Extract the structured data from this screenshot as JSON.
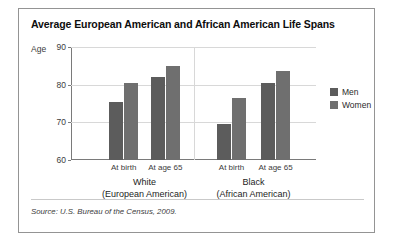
{
  "figure": {
    "title": "Average European American and African American Life Spans",
    "source_note": "Source: U.S. Bureau of the Census, 2009."
  },
  "legend": {
    "position": "right",
    "entries": [
      {
        "label": "Men",
        "color": "#5c5c5c"
      },
      {
        "label": "Women",
        "color": "#6f6f6f"
      }
    ]
  },
  "axis": {
    "y_axis_title": "Age",
    "ticks": [
      "90",
      "80",
      "70",
      "60"
    ]
  },
  "groups": [
    {
      "name": "White",
      "subtitle": "(European American)",
      "subcategories": [
        "At birth",
        "At age 65"
      ]
    },
    {
      "name": "Black",
      "subtitle": "(African American)",
      "subcategories": [
        "At birth",
        "At age 65"
      ]
    }
  ],
  "chart_data": {
    "type": "bar",
    "title": "Average European American and African American Life Spans",
    "xlabel": "",
    "ylabel": "Age",
    "ylim": [
      60,
      90
    ],
    "yticks": [
      60,
      70,
      80,
      90
    ],
    "grid": true,
    "legend_position": "right",
    "categories": [
      "White (European American) — At birth",
      "White (European American) — At age 65",
      "Black (African American) — At birth",
      "Black (African American) — At age 65"
    ],
    "series": [
      {
        "name": "Men",
        "color": "#5c5c5c",
        "values": [
          75.5,
          82.0,
          69.5,
          80.5
        ]
      },
      {
        "name": "Women",
        "color": "#6f6f6f",
        "values": [
          80.5,
          85.0,
          76.5,
          83.5
        ]
      }
    ],
    "source": "Source: U.S. Bureau of the Census, 2009."
  }
}
